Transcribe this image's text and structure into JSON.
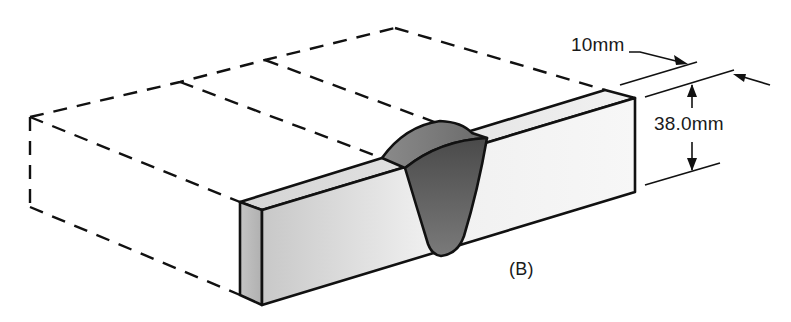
{
  "figure": {
    "label": "(B)"
  },
  "dimensions": {
    "width_label": "10mm",
    "height_label": "38.0mm"
  },
  "colors": {
    "line": "#111111",
    "weld_dark": "#5a5a5a",
    "weld_light": "#9a9a9a",
    "bar_face_light": "#f4f4f4",
    "bar_face_dark": "#bcbcbc"
  }
}
